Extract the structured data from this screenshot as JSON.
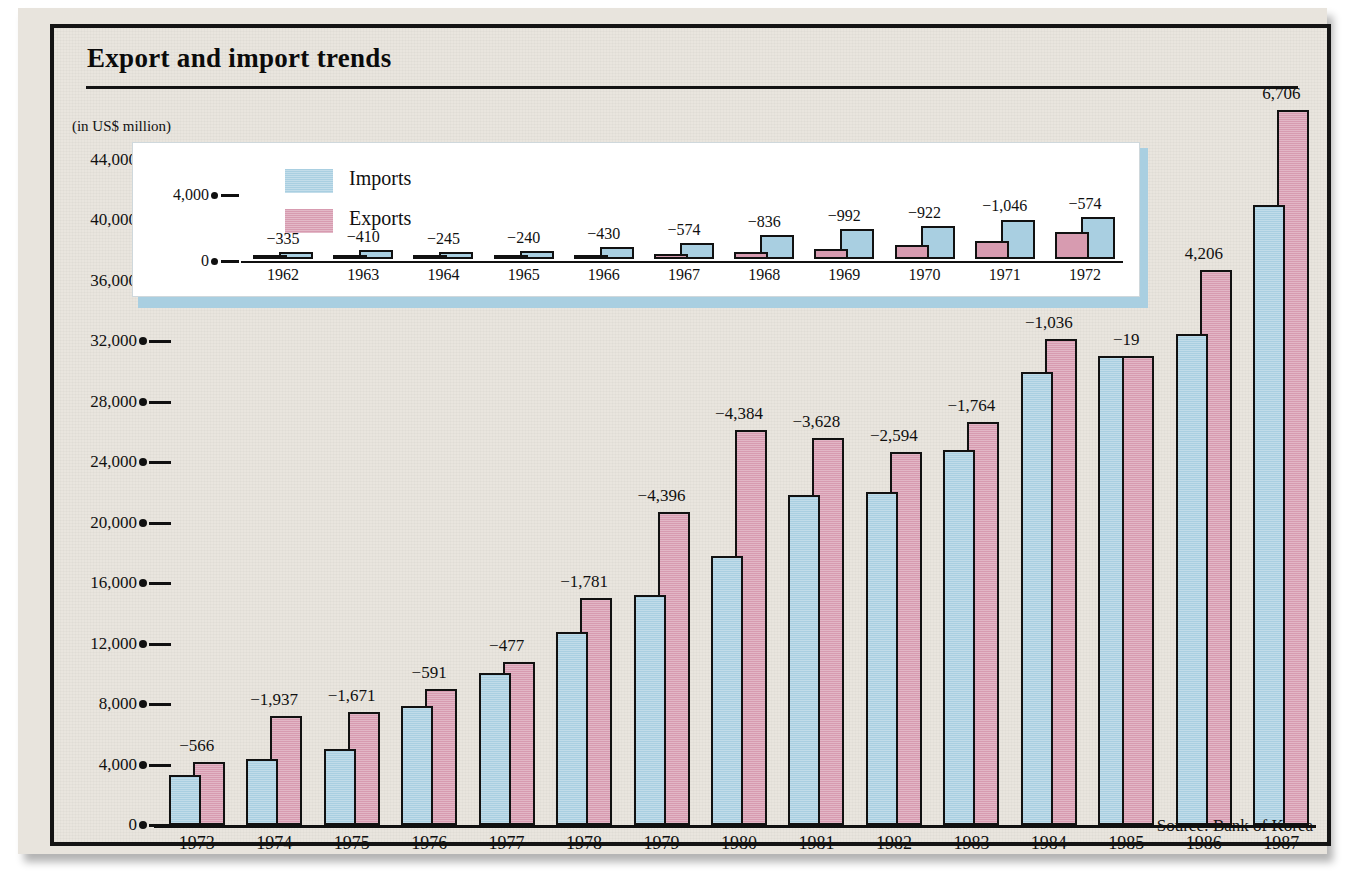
{
  "header": {
    "title": "Export and import trends",
    "units_note": "(in US$ million)"
  },
  "source": "Source: Bank of Korea",
  "legend": {
    "imports_label": "Imports",
    "exports_label": "Exports",
    "imports_color": "#a9cfe1",
    "exports_color": "#d79bb0"
  },
  "chart_data": {
    "type": "bar",
    "title": "Export and import trends",
    "subtitle": "(in US$ million)",
    "xlabel": "",
    "ylabel": "in US$ million",
    "grid": false,
    "legend_position": "inset-top-left",
    "series_colors": {
      "Imports": "#a9cfe1",
      "Exports": "#d79bb0"
    },
    "main_panel": {
      "ylim": [
        0,
        44000
      ],
      "ytick_labels": [
        "0",
        "4,000",
        "8,000",
        "12,000",
        "16,000",
        "20,000",
        "24,000",
        "28,000",
        "32,000",
        "36,000",
        "40,000",
        "44,000"
      ],
      "yticks": [
        0,
        4000,
        8000,
        12000,
        16000,
        20000,
        24000,
        28000,
        32000,
        36000,
        40000,
        44000
      ],
      "categories": [
        "1973",
        "1974",
        "1975",
        "1976",
        "1977",
        "1978",
        "1979",
        "1980",
        "1981",
        "1982",
        "1983",
        "1984",
        "1985",
        "1986",
        "1987"
      ],
      "series": [
        {
          "name": "Imports",
          "values": [
            3280,
            4380,
            5050,
            7870,
            10090,
            12780,
            15250,
            17770,
            21840,
            22050,
            24830,
            29990,
            31030,
            32480,
            41010
          ]
        },
        {
          "name": "Exports",
          "values": [
            4180,
            7240,
            7500,
            9000,
            10810,
            15040,
            20710,
            26150,
            25630,
            24680,
            26640,
            32130,
            31010,
            36700,
            47280
          ]
        }
      ],
      "balance_labels": [
        "−566",
        "−1,937",
        "−1,671",
        "−591",
        "−477",
        "−1,781",
        "−4,396",
        "−4,384",
        "−3,628",
        "−2,594",
        "−1,764",
        "−1,036",
        "−19",
        "4,206",
        "6,706"
      ],
      "balance_values": [
        -566,
        -1937,
        -1671,
        -591,
        -477,
        -1781,
        -4396,
        -4384,
        -3628,
        -2594,
        -1764,
        -1036,
        -19,
        4206,
        6706
      ]
    },
    "inset_panel": {
      "ylim": [
        0,
        4000
      ],
      "ytick_labels": [
        "0",
        "4,000"
      ],
      "yticks": [
        0,
        4000
      ],
      "categories": [
        "1962",
        "1963",
        "1964",
        "1965",
        "1966",
        "1967",
        "1968",
        "1969",
        "1970",
        "1971",
        "1972"
      ],
      "series": [
        {
          "name": "Imports",
          "values": [
            422,
            560,
            404,
            463,
            716,
            996,
            1463,
            1824,
            1984,
            2394,
            2522
          ]
        },
        {
          "name": "Exports",
          "values": [
            55,
            87,
            119,
            175,
            250,
            320,
            455,
            623,
            835,
            1068,
            1624
          ]
        }
      ],
      "balance_labels": [
        "−335",
        "−410",
        "−245",
        "−240",
        "−430",
        "−574",
        "−836",
        "−992",
        "−922",
        "−1,046",
        "−574"
      ],
      "balance_values": [
        -335,
        -410,
        -245,
        -240,
        -430,
        -574,
        -836,
        -992,
        -922,
        -1046,
        -574
      ]
    }
  }
}
